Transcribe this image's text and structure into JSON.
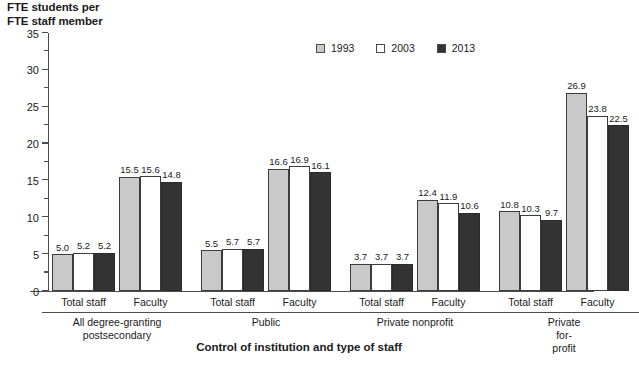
{
  "chart_data": {
    "type": "bar",
    "title": "",
    "ylabel": "FTE students per\nFTE staff member",
    "xlabel": "Control of institution and type of staff",
    "ylim": [
      0,
      35
    ],
    "yticks": [
      0,
      5,
      10,
      15,
      20,
      25,
      30,
      35
    ],
    "minor_tick_step": 2.5,
    "grid": false,
    "legend_position": "top-center",
    "legend": [
      "1993",
      "2003",
      "2013"
    ],
    "series": [
      {
        "name": "1993",
        "color": "#c9c9c9",
        "values": [
          5.0,
          15.5,
          5.5,
          16.6,
          3.7,
          12.4,
          10.8,
          26.9
        ]
      },
      {
        "name": "2003",
        "color": "#ffffff",
        "values": [
          5.2,
          15.6,
          5.7,
          16.9,
          3.7,
          11.9,
          10.3,
          23.8
        ]
      },
      {
        "name": "2013",
        "color": "#333333",
        "values": [
          5.2,
          14.8,
          5.7,
          16.1,
          3.7,
          10.6,
          9.7,
          22.5
        ]
      }
    ],
    "categories": [
      "Total staff",
      "Faculty",
      "Total staff",
      "Faculty",
      "Total staff",
      "Faculty",
      "Total staff",
      "Faculty"
    ],
    "groups": [
      {
        "label": "All degree-granting\npostsecondary",
        "categories": [
          "Total staff",
          "Faculty"
        ]
      },
      {
        "label": "Public",
        "categories": [
          "Total staff",
          "Faculty"
        ]
      },
      {
        "label": "Private nonprofit",
        "categories": [
          "Total staff",
          "Faculty"
        ]
      },
      {
        "label": "Private for-profit",
        "categories": [
          "Total staff",
          "Faculty"
        ]
      }
    ],
    "value_labels": [
      [
        "5.0",
        "5.2",
        "5.2"
      ],
      [
        "15.5",
        "15.6",
        "14.8"
      ],
      [
        "5.5",
        "5.7",
        "5.7"
      ],
      [
        "16.6",
        "16.9",
        "16.1"
      ],
      [
        "3.7",
        "3.7",
        "3.7"
      ],
      [
        "12.4",
        "11.9",
        "10.6"
      ],
      [
        "10.8",
        "10.3",
        "9.7"
      ],
      [
        "26.9",
        "23.8",
        "22.5"
      ]
    ]
  },
  "colors": {
    "series_1993": "#c9c9c9",
    "series_2003": "#ffffff",
    "series_2013": "#333333",
    "axis": "#4d4d4d",
    "text": "#1a1a1a",
    "background": "#ffffff"
  }
}
